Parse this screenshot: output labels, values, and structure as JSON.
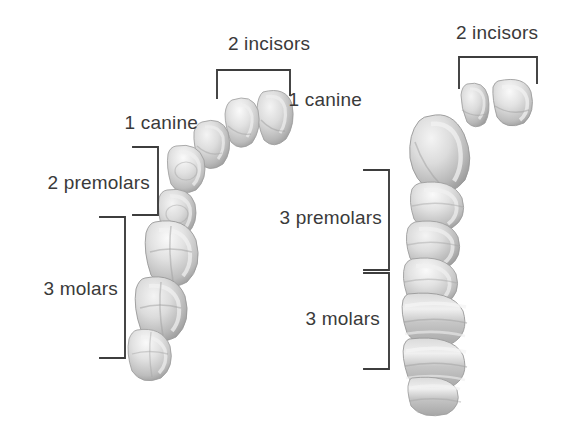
{
  "figure": {
    "background_color": "#ffffff",
    "text_color": "#3a3a3a",
    "line_color": "#3d3d3d",
    "tooth_fill": "#cfcfcf",
    "tooth_shadow": "#8f8f8f",
    "tooth_highlight": "#f2f2f2"
  },
  "arches": [
    {
      "id": "left-arch",
      "name": "human-dental-arch",
      "groups": [
        {
          "id": "left-incisors",
          "label": "2 incisors",
          "count": 2,
          "tooth_type": "incisor",
          "bracket": "horizontal-top",
          "label_x": 216,
          "label_y": 33,
          "label_align": "center",
          "label_width": 106
        },
        {
          "id": "left-canine",
          "label": "1 canine",
          "count": 1,
          "tooth_type": "canine",
          "bracket": "none",
          "label_x": 108,
          "label_y": 112,
          "label_align": "right",
          "label_width": 90
        },
        {
          "id": "left-premolars",
          "label": "2 premolars",
          "count": 2,
          "tooth_type": "premolar",
          "bracket": "vertical-right",
          "label_x": 26,
          "label_y": 172,
          "label_align": "right",
          "label_width": 124
        },
        {
          "id": "left-molars",
          "label": "3 molars",
          "count": 3,
          "tooth_type": "molar",
          "bracket": "vertical-right",
          "label_x": 28,
          "label_y": 278,
          "label_align": "right",
          "label_width": 90
        }
      ]
    },
    {
      "id": "right-arch",
      "name": "ape-dental-arch",
      "groups": [
        {
          "id": "right-incisors",
          "label": "2 incisors",
          "count": 2,
          "tooth_type": "incisor",
          "bracket": "horizontal-top",
          "label_x": 444,
          "label_y": 22,
          "label_align": "center",
          "label_width": 106
        },
        {
          "id": "right-canine",
          "label": "1 canine",
          "count": 1,
          "tooth_type": "canine",
          "bracket": "none",
          "label_x": 272,
          "label_y": 89,
          "label_align": "right",
          "label_width": 90
        },
        {
          "id": "right-premolars",
          "label": "3 premolars",
          "count": 3,
          "tooth_type": "premolar",
          "bracket": "vertical-right",
          "label_x": 258,
          "label_y": 207,
          "label_align": "right",
          "label_width": 124
        },
        {
          "id": "right-molars",
          "label": "3 molars",
          "count": 3,
          "tooth_type": "molar",
          "bracket": "vertical-right",
          "label_x": 290,
          "label_y": 308,
          "label_align": "right",
          "label_width": 90
        }
      ]
    }
  ]
}
